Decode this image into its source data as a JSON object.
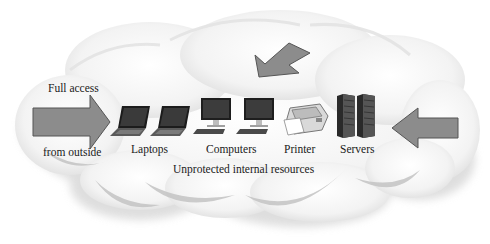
{
  "diagram": {
    "labels": {
      "full_access": "Full access",
      "from_outside": "from outside",
      "laptops": "Laptops",
      "computers": "Computers",
      "printer": "Printer",
      "servers": "Servers",
      "caption": "Unprotected internal resources"
    },
    "arrows": [
      {
        "id": "left",
        "direction": "right",
        "label": "Full access from outside"
      },
      {
        "id": "top",
        "direction": "down-left"
      },
      {
        "id": "right",
        "direction": "left"
      }
    ],
    "devices": [
      {
        "type": "laptop",
        "count": 2
      },
      {
        "type": "desktop-computer",
        "count": 2
      },
      {
        "type": "printer",
        "count": 1
      },
      {
        "type": "server",
        "count": 2
      }
    ],
    "colors": {
      "arrow_fill": "#8a8a8a",
      "arrow_stroke": "#5a5a5a",
      "cloud_fill": "#f4f4f4",
      "cloud_shadow": "#b8b8b8"
    }
  }
}
